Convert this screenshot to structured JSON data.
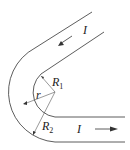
{
  "labels": {
    "current_top": "I",
    "current_bottom": "I",
    "r1": "R",
    "r1_sub": "1",
    "r2": "R",
    "r2_sub": "2",
    "r": "r"
  },
  "colors": {
    "stroke": "#333333"
  }
}
